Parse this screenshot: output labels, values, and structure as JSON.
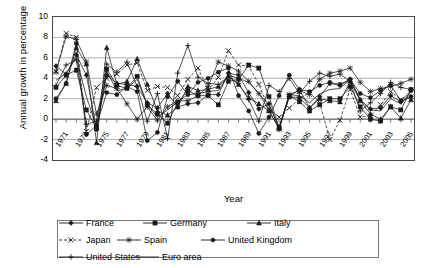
{
  "chart_data": {
    "type": "line",
    "title": "",
    "xlabel": "Year",
    "ylabel": "Annual growth in percentage",
    "ylim": [
      -4,
      10
    ],
    "yticks": [
      10,
      8,
      6,
      4,
      2,
      0,
      -2,
      -4
    ],
    "xlim": [
      1971,
      2006
    ],
    "grid": true,
    "legend_position": "bottom",
    "x": [
      1971,
      1972,
      1973,
      1974,
      1975,
      1976,
      1977,
      1978,
      1979,
      1980,
      1981,
      1982,
      1983,
      1984,
      1985,
      1986,
      1987,
      1988,
      1989,
      1990,
      1991,
      1992,
      1993,
      1994,
      1995,
      1996,
      1997,
      1998,
      1999,
      2000,
      2001,
      2002,
      2003,
      2004,
      2005,
      2006
    ],
    "xtick_labels": [
      "1971",
      "1973",
      "1975",
      "1977",
      "1979",
      "1981",
      "1983",
      "1985",
      "1987",
      "1989",
      "1991",
      "1993",
      "1995",
      "1997",
      "1999",
      "2001",
      "2003",
      "2005"
    ],
    "series": [
      {
        "name": "France",
        "marker": "diamond",
        "dash": "solid",
        "values": [
          5.2,
          4.4,
          6.3,
          4.3,
          -1.0,
          4.3,
          3.5,
          3.4,
          3.2,
          1.6,
          1.1,
          2.5,
          1.2,
          1.5,
          1.6,
          2.4,
          2.4,
          4.5,
          4.3,
          2.6,
          1.0,
          1.5,
          -0.9,
          2.2,
          2.1,
          1.1,
          2.2,
          3.5,
          3.3,
          3.9,
          1.9,
          1.0,
          1.1,
          2.3,
          1.7,
          2.2
        ]
      },
      {
        "name": "Germany",
        "marker": "square",
        "dash": "solid",
        "values": [
          3.1,
          4.3,
          4.8,
          0.9,
          -0.9,
          4.9,
          3.3,
          3.0,
          4.2,
          1.4,
          0.5,
          -0.4,
          1.6,
          2.8,
          2.3,
          2.3,
          1.4,
          3.7,
          3.9,
          5.3,
          5.0,
          2.2,
          -0.8,
          2.3,
          1.7,
          0.8,
          1.4,
          2.0,
          2.0,
          3.2,
          1.2,
          0.0,
          -0.2,
          1.2,
          0.9,
          2.9
        ]
      },
      {
        "name": "Italy",
        "marker": "triangle",
        "dash": "solid",
        "values": [
          1.8,
          3.5,
          7.0,
          5.4,
          -2.3,
          7.0,
          3.4,
          3.7,
          5.9,
          3.4,
          0.8,
          0.4,
          1.2,
          3.2,
          2.8,
          2.9,
          3.2,
          4.2,
          3.4,
          2.1,
          1.5,
          0.8,
          -0.9,
          2.2,
          2.9,
          1.1,
          2.0,
          1.8,
          1.7,
          3.7,
          1.8,
          0.5,
          0.0,
          1.2,
          0.1,
          1.9
        ]
      },
      {
        "name": "Japan",
        "marker": "x",
        "dash": "dashed",
        "values": [
          4.7,
          8.4,
          8.0,
          -1.2,
          3.1,
          4.0,
          4.4,
          5.3,
          5.5,
          2.8,
          3.2,
          3.1,
          2.3,
          3.9,
          5.0,
          2.8,
          4.1,
          6.7,
          5.3,
          5.2,
          3.4,
          1.0,
          0.2,
          1.1,
          2.0,
          2.6,
          1.6,
          -2.0,
          -0.1,
          2.9,
          0.2,
          0.3,
          1.4,
          2.7,
          1.9,
          2.2
        ]
      },
      {
        "name": "Spain",
        "marker": "star",
        "dash": "solid",
        "values": [
          4.6,
          8.1,
          7.8,
          5.6,
          0.5,
          3.3,
          3.0,
          1.5,
          0.0,
          1.2,
          -0.1,
          1.2,
          1.8,
          1.8,
          2.3,
          3.2,
          5.6,
          5.2,
          4.7,
          3.7,
          2.5,
          0.9,
          -1.0,
          2.4,
          2.8,
          2.4,
          3.9,
          4.5,
          4.7,
          5.0,
          3.6,
          2.7,
          3.0,
          3.2,
          3.5,
          3.9
        ]
      },
      {
        "name": "United Kingdom",
        "marker": "circle",
        "dash": "solid",
        "values": [
          2.0,
          3.5,
          7.4,
          -1.5,
          -0.6,
          2.6,
          2.4,
          3.2,
          2.7,
          -2.1,
          -1.3,
          2.2,
          3.7,
          2.4,
          3.6,
          4.0,
          4.6,
          5.0,
          2.3,
          0.8,
          -1.4,
          0.2,
          2.3,
          4.3,
          2.9,
          2.7,
          3.3,
          3.6,
          3.4,
          3.9,
          2.5,
          2.1,
          2.8,
          3.3,
          1.8,
          2.8
        ]
      },
      {
        "name": "United States",
        "marker": "plus",
        "dash": "solid",
        "values": [
          3.3,
          5.3,
          5.8,
          -0.5,
          -0.2,
          5.4,
          4.6,
          5.6,
          3.2,
          -0.2,
          2.5,
          -1.9,
          4.5,
          7.2,
          4.1,
          3.5,
          3.4,
          4.1,
          3.5,
          1.9,
          -0.2,
          3.3,
          2.7,
          4.0,
          2.5,
          3.7,
          4.5,
          4.2,
          4.4,
          3.7,
          0.8,
          1.6,
          2.5,
          3.6,
          3.1,
          2.9
        ]
      },
      {
        "name": "Euro area",
        "marker": "none",
        "dash": "solid",
        "values": [
          3.8,
          4.5,
          6.0,
          2.2,
          -0.8,
          4.7,
          2.8,
          3.0,
          3.9,
          1.4,
          0.2,
          0.9,
          1.7,
          2.4,
          2.5,
          2.7,
          2.8,
          4.3,
          4.0,
          3.6,
          2.5,
          1.4,
          -0.8,
          2.4,
          2.3,
          1.6,
          2.5,
          2.9,
          3.0,
          3.9,
          1.9,
          0.9,
          0.8,
          2.0,
          1.5,
          2.7
        ]
      }
    ]
  },
  "axes": {
    "y_title": "Annual growth in percentage",
    "x_title": "Year",
    "y_labels": [
      "10",
      "8",
      "6",
      "4",
      "2",
      "0",
      "-2",
      "-4"
    ],
    "x_labels": [
      "1971",
      "1973",
      "1975",
      "1977",
      "1979",
      "1981",
      "1983",
      "1985",
      "1987",
      "1989",
      "1991",
      "1993",
      "1995",
      "1997",
      "1999",
      "2001",
      "2003",
      "2005"
    ]
  },
  "legend": {
    "items": [
      {
        "label": "France",
        "marker": "diamond",
        "dash": "solid"
      },
      {
        "label": "Germany",
        "marker": "square",
        "dash": "solid"
      },
      {
        "label": "Italy",
        "marker": "triangle",
        "dash": "solid"
      },
      {
        "label": "Japan",
        "marker": "x",
        "dash": "dashed"
      },
      {
        "label": "Spain",
        "marker": "star",
        "dash": "solid"
      },
      {
        "label": "United Kingdom",
        "marker": "circle",
        "dash": "solid"
      },
      {
        "label": "United States",
        "marker": "plus",
        "dash": "solid"
      },
      {
        "label": "Euro area",
        "marker": "none",
        "dash": "solid"
      }
    ]
  },
  "colors": {
    "line": "#1a1a1a",
    "grid": "#9a9a9a",
    "frame": "#4a4a4a",
    "background": "#ffffff"
  }
}
